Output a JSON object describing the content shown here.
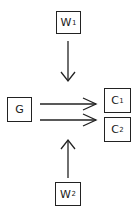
{
  "diagram": {
    "nodes": [
      {
        "id": "W1",
        "label": "W",
        "sub": "1"
      },
      {
        "id": "G",
        "label": "G",
        "sub": ""
      },
      {
        "id": "C1",
        "label": "C",
        "sub": "1"
      },
      {
        "id": "C2",
        "label": "C",
        "sub": "2"
      },
      {
        "id": "W2",
        "label": "W",
        "sub": "2"
      }
    ],
    "edges": [
      {
        "from": "W1",
        "to": "center",
        "direction": "down"
      },
      {
        "from": "G",
        "to": "C1",
        "direction": "right"
      },
      {
        "from": "G",
        "to": "C2",
        "direction": "right"
      },
      {
        "from": "W2",
        "to": "center",
        "direction": "up"
      }
    ],
    "colors": {
      "stroke": "#222222",
      "background": "#ffffff"
    }
  }
}
